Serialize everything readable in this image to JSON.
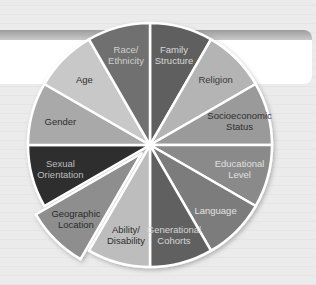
{
  "diagram": {
    "type": "segmented-wheel",
    "center": [
      150,
      145
    ],
    "radius": 122,
    "exploded_offset": 12,
    "segments": [
      {
        "label_lines": [
          "Family",
          "Structure"
        ],
        "fill": "#5e5e5e",
        "text_color": "#d8d8d8",
        "start": 0,
        "end": 30,
        "exploded": false
      },
      {
        "label_lines": [
          "Religion"
        ],
        "fill": "#b4b4b4",
        "text_color": "#3a3a3a",
        "start": 30,
        "end": 60,
        "exploded": false
      },
      {
        "label_lines": [
          "Socioeconomic",
          "Status"
        ],
        "fill": "#9a9a9a",
        "text_color": "#2e2e2e",
        "start": 60,
        "end": 90,
        "exploded": false
      },
      {
        "label_lines": [
          "Educational",
          "Level"
        ],
        "fill": "#8a8a8a",
        "text_color": "#e0e0e0",
        "start": 90,
        "end": 120,
        "exploded": false
      },
      {
        "label_lines": [
          "Language"
        ],
        "fill": "#7b7b7b",
        "text_color": "#e2e2e2",
        "start": 120,
        "end": 150,
        "exploded": false
      },
      {
        "label_lines": [
          "Generational",
          "Cohorts"
        ],
        "fill": "#616161",
        "text_color": "#d6d6d6",
        "start": 150,
        "end": 180,
        "exploded": false
      },
      {
        "label_lines": [
          "Ability/",
          "Disability"
        ],
        "fill": "#bdbdbd",
        "text_color": "#2e2e2e",
        "start": 180,
        "end": 210,
        "exploded": false
      },
      {
        "label_lines": [
          "Geographic",
          "Location"
        ],
        "fill": "#8e8e8e",
        "text_color": "#2a2a2a",
        "start": 210,
        "end": 240,
        "exploded": true
      },
      {
        "label_lines": [
          "Sexual",
          "Orientation"
        ],
        "fill": "#2f2f2f",
        "text_color": "#bdbdbd",
        "start": 240,
        "end": 270,
        "exploded": false
      },
      {
        "label_lines": [
          "Gender"
        ],
        "fill": "#a9a9a9",
        "text_color": "#2e2e2e",
        "start": 270,
        "end": 300,
        "exploded": false
      },
      {
        "label_lines": [
          "Age"
        ],
        "fill": "#c8c8c8",
        "text_color": "#2e2e2e",
        "start": 300,
        "end": 330,
        "exploded": false
      },
      {
        "label_lines": [
          "Race/",
          "Ethnicity"
        ],
        "fill": "#707070",
        "text_color": "#cfcfcf",
        "start": 330,
        "end": 360,
        "exploded": false
      }
    ]
  }
}
